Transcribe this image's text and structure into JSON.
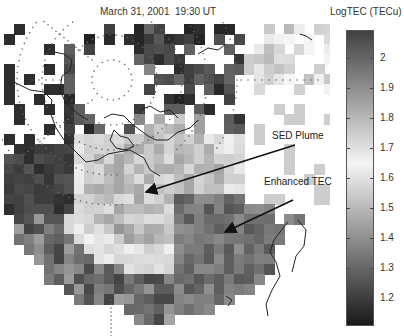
{
  "figure": {
    "title": "March 31, 2001  19:30 UT",
    "colorbar": {
      "title": "LogTEC (TECu)",
      "ticks": [
        {
          "label": "2",
          "y": 58
        },
        {
          "label": "1.9",
          "y": 88
        },
        {
          "label": "1.8",
          "y": 118
        },
        {
          "label": "1.7",
          "y": 148
        },
        {
          "label": "1.6",
          "y": 178
        },
        {
          "label": "1.5",
          "y": 208
        },
        {
          "label": "1.4",
          "y": 238
        },
        {
          "label": "1.3",
          "y": 268
        },
        {
          "label": "1.2",
          "y": 298
        }
      ],
      "range": [
        1.1,
        2.1
      ],
      "colormap": "gray: dark at extremes, light near 1.6-1.7"
    },
    "annotations": [
      {
        "label": "SED Plume",
        "text_x": 272,
        "text_y": 135,
        "arrow_from": [
          295,
          145
        ],
        "arrow_to": [
          143,
          193
        ]
      },
      {
        "label": "Enhanced TEC",
        "text_x": 264,
        "text_y": 182,
        "arrow_from": [
          293,
          200
        ],
        "arrow_to": [
          222,
          234
        ]
      }
    ]
  }
}
